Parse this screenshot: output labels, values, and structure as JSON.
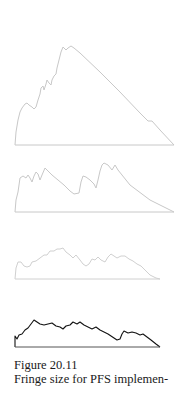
{
  "figure": {
    "number_label": "Figure 20.11",
    "caption_line": "Fringe size for PFS implemen-"
  },
  "chart_data": [
    {
      "type": "area",
      "panel": 1,
      "stroke": "#c8c8c8",
      "points": [
        [
          15,
          145
        ],
        [
          16,
          132
        ],
        [
          18,
          120
        ],
        [
          20,
          112
        ],
        [
          22,
          108
        ],
        [
          25,
          104
        ],
        [
          27,
          103
        ],
        [
          29,
          105
        ],
        [
          32,
          107
        ],
        [
          34,
          109
        ],
        [
          36,
          107
        ],
        [
          38,
          100
        ],
        [
          40,
          94
        ],
        [
          41,
          88
        ],
        [
          43,
          86
        ],
        [
          44,
          90
        ],
        [
          46,
          84
        ],
        [
          47,
          80
        ],
        [
          49,
          83
        ],
        [
          51,
          85
        ],
        [
          52,
          80
        ],
        [
          54,
          76
        ],
        [
          56,
          74
        ],
        [
          57,
          68
        ],
        [
          59,
          60
        ],
        [
          61,
          52
        ],
        [
          63,
          47
        ],
        [
          66,
          50
        ],
        [
          68,
          48
        ],
        [
          71,
          46
        ],
        [
          74,
          48
        ],
        [
          80,
          53
        ],
        [
          100,
          72
        ],
        [
          120,
          92
        ],
        [
          140,
          113
        ],
        [
          148,
          121
        ],
        [
          152,
          121
        ],
        [
          160,
          130
        ],
        [
          174,
          145
        ]
      ]
    },
    {
      "type": "area",
      "panel": 2,
      "stroke": "#c8c8c8",
      "points": [
        [
          15,
          212
        ],
        [
          16,
          200
        ],
        [
          18,
          192
        ],
        [
          20,
          178
        ],
        [
          23,
          176
        ],
        [
          26,
          178
        ],
        [
          28,
          175
        ],
        [
          30,
          178
        ],
        [
          32,
          182
        ],
        [
          34,
          176
        ],
        [
          36,
          172
        ],
        [
          38,
          174
        ],
        [
          40,
          180
        ],
        [
          42,
          175
        ],
        [
          45,
          168
        ],
        [
          48,
          171
        ],
        [
          52,
          175
        ],
        [
          58,
          180
        ],
        [
          64,
          185
        ],
        [
          70,
          191
        ],
        [
          74,
          194
        ],
        [
          79,
          193
        ],
        [
          81,
          182
        ],
        [
          83,
          176
        ],
        [
          86,
          177
        ],
        [
          90,
          180
        ],
        [
          94,
          184
        ],
        [
          96,
          188
        ],
        [
          98,
          180
        ],
        [
          100,
          171
        ],
        [
          102,
          165
        ],
        [
          104,
          163
        ],
        [
          108,
          165
        ],
        [
          112,
          170
        ],
        [
          115,
          165
        ],
        [
          118,
          170
        ],
        [
          130,
          185
        ],
        [
          150,
          200
        ],
        [
          174,
          212
        ]
      ]
    },
    {
      "type": "area",
      "panel": 3,
      "stroke": "#d0d0d0",
      "points": [
        [
          15,
          279
        ],
        [
          16,
          268
        ],
        [
          18,
          262
        ],
        [
          21,
          262
        ],
        [
          24,
          266
        ],
        [
          27,
          267
        ],
        [
          30,
          266
        ],
        [
          32,
          262
        ],
        [
          36,
          261
        ],
        [
          40,
          258
        ],
        [
          44,
          255
        ],
        [
          47,
          255
        ],
        [
          50,
          251
        ],
        [
          54,
          251
        ],
        [
          57,
          249
        ],
        [
          60,
          249
        ],
        [
          63,
          248
        ],
        [
          66,
          252
        ],
        [
          70,
          255
        ],
        [
          73,
          258
        ],
        [
          76,
          255
        ],
        [
          80,
          260
        ],
        [
          83,
          264
        ],
        [
          86,
          266
        ],
        [
          89,
          264
        ],
        [
          92,
          259
        ],
        [
          95,
          260
        ],
        [
          98,
          257
        ],
        [
          101,
          260
        ],
        [
          105,
          262
        ],
        [
          108,
          257
        ],
        [
          111,
          254
        ],
        [
          114,
          256
        ],
        [
          117,
          258
        ],
        [
          121,
          256
        ],
        [
          125,
          256
        ],
        [
          129,
          259
        ],
        [
          133,
          261
        ],
        [
          137,
          264
        ],
        [
          141,
          266
        ],
        [
          145,
          270
        ],
        [
          150,
          275
        ],
        [
          156,
          278
        ],
        [
          160,
          279
        ]
      ]
    },
    {
      "type": "area",
      "panel": 4,
      "stroke": "#111111",
      "points": [
        [
          15,
          347
        ],
        [
          15,
          336
        ],
        [
          17,
          339
        ],
        [
          19,
          335
        ],
        [
          22,
          334
        ],
        [
          25,
          330
        ],
        [
          28,
          328
        ],
        [
          31,
          324
        ],
        [
          34,
          320
        ],
        [
          37,
          322
        ],
        [
          40,
          324
        ],
        [
          44,
          325
        ],
        [
          48,
          324
        ],
        [
          52,
          323
        ],
        [
          56,
          326
        ],
        [
          60,
          327
        ],
        [
          63,
          329
        ],
        [
          66,
          326
        ],
        [
          70,
          325
        ],
        [
          73,
          322
        ],
        [
          77,
          324
        ],
        [
          80,
          322
        ],
        [
          84,
          325
        ],
        [
          88,
          327
        ],
        [
          92,
          329
        ],
        [
          96,
          327
        ],
        [
          100,
          330
        ],
        [
          104,
          332
        ],
        [
          108,
          334
        ],
        [
          111,
          336
        ],
        [
          114,
          338
        ],
        [
          117,
          340
        ],
        [
          120,
          339
        ],
        [
          122,
          334
        ],
        [
          124,
          331
        ],
        [
          128,
          333
        ],
        [
          132,
          332
        ],
        [
          136,
          333
        ],
        [
          140,
          335
        ],
        [
          143,
          334
        ],
        [
          147,
          337
        ],
        [
          151,
          340
        ],
        [
          156,
          344
        ],
        [
          160,
          347
        ]
      ]
    }
  ]
}
